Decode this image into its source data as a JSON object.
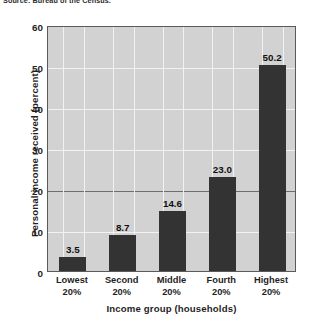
{
  "source_note": "Source: Bureau of the Census.",
  "chart_data": {
    "type": "bar",
    "title": "",
    "categories": [
      "Lowest 20%",
      "Second 20%",
      "Middle 20%",
      "Fourth 20%",
      "Highest 20%"
    ],
    "category_lines": [
      [
        "Lowest",
        "20%"
      ],
      [
        "Second",
        "20%"
      ],
      [
        "Middle",
        "20%"
      ],
      [
        "Fourth",
        "20%"
      ],
      [
        "Highest",
        "20%"
      ]
    ],
    "values": [
      3.5,
      8.7,
      14.6,
      23.0,
      50.2
    ],
    "value_labels": [
      "3.5",
      "8.7",
      "14.6",
      "23.0",
      "50.2"
    ],
    "xlabel": "Income group (households)",
    "ylabel": "Personal income received (percent)",
    "ylim": [
      0,
      60
    ],
    "yticks": [
      0,
      10,
      20,
      30,
      40,
      50,
      60
    ],
    "ytick_labels": [
      "0",
      "10",
      "20",
      "30",
      "40",
      "50",
      "60"
    ],
    "grid": true,
    "legend": "none",
    "colors": {
      "bar": "#333333",
      "plot_background": "#d2d2d2",
      "gridline": "#f2f2f2",
      "gridline_major": "#6e6e6e",
      "axis": "#5a5a5a",
      "text": "#1f1f1f"
    }
  }
}
